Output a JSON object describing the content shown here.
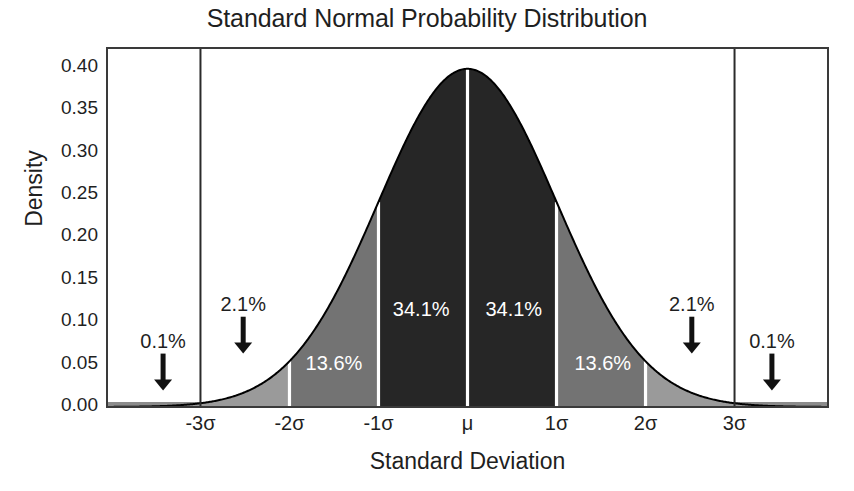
{
  "chart_data": {
    "type": "area",
    "title": "Standard Normal Probability Distribution",
    "xlabel": "Standard Deviation",
    "ylabel": "Density",
    "xtick_labels": [
      "-3σ",
      "-2σ",
      "-1σ",
      "μ",
      "1σ",
      "2σ",
      "3σ"
    ],
    "xtick_values": [
      -3,
      -2,
      -1,
      0,
      1,
      2,
      3
    ],
    "ytick_labels": [
      "0.40",
      "0.35",
      "0.30",
      "0.25",
      "0.20",
      "0.15",
      "0.10",
      "0.05",
      "0.00"
    ],
    "ytick_values": [
      0.4,
      0.35,
      0.3,
      0.25,
      0.2,
      0.15,
      0.1,
      0.05,
      0.0
    ],
    "xlim": [
      -4.05,
      4.05
    ],
    "ylim": [
      0.0,
      0.4235
    ],
    "grid": false,
    "legend": false,
    "distribution": {
      "name": "standard normal",
      "mean": 0,
      "sd": 1,
      "peak_density": 0.3989
    },
    "bands": [
      {
        "from": -4.05,
        "to": -3,
        "label": "0.1%",
        "fill": "#9a9a9a",
        "label_placement": "outside"
      },
      {
        "from": -3,
        "to": -2,
        "label": "2.1%",
        "fill": "#9a9a9a",
        "label_placement": "outside"
      },
      {
        "from": -2,
        "to": -1,
        "label": "13.6%",
        "fill": "#737373",
        "label_placement": "inside"
      },
      {
        "from": -1,
        "to": 0,
        "label": "34.1%",
        "fill": "#262626",
        "label_placement": "inside"
      },
      {
        "from": 0,
        "to": 1,
        "label": "34.1%",
        "fill": "#262626",
        "label_placement": "inside"
      },
      {
        "from": 1,
        "to": 2,
        "label": "13.6%",
        "fill": "#737373",
        "label_placement": "inside"
      },
      {
        "from": 2,
        "to": 3,
        "label": "2.1%",
        "fill": "#9a9a9a",
        "label_placement": "outside"
      },
      {
        "from": 3,
        "to": 4.05,
        "label": "0.1%",
        "fill": "#9a9a9a",
        "label_placement": "outside"
      }
    ],
    "inside_labels": [
      {
        "text": "13.6%",
        "x": -1.5,
        "y": 0.052
      },
      {
        "text": "34.1%",
        "x": -0.52,
        "y": 0.116
      },
      {
        "text": "34.1%",
        "x": 0.52,
        "y": 0.116
      },
      {
        "text": "13.6%",
        "x": 1.52,
        "y": 0.052
      }
    ],
    "outside_annotations": [
      {
        "text": "0.1%",
        "x": -3.42,
        "text_y": 0.0745,
        "arrow_from_y": 0.063,
        "arrow_to_y": 0.0195
      },
      {
        "text": "2.1%",
        "x": -2.52,
        "text_y": 0.118,
        "arrow_from_y": 0.1065,
        "arrow_to_y": 0.063
      },
      {
        "text": "2.1%",
        "x": 2.52,
        "text_y": 0.118,
        "arrow_from_y": 0.1065,
        "arrow_to_y": 0.063
      },
      {
        "text": "0.1%",
        "x": 3.42,
        "text_y": 0.0745,
        "arrow_from_y": 0.063,
        "arrow_to_y": 0.0195
      }
    ],
    "vertical_rules": [
      {
        "x": -3,
        "full_height": true
      },
      {
        "x": 3,
        "full_height": true
      }
    ],
    "divider_color": "#ffffff",
    "curve_color": "#000000",
    "frame_color": "#3a3a3a",
    "background_color": "#ffffff",
    "baseline_strip_color": "#8c8c8c"
  },
  "geometry": {
    "plot_left": 107,
    "plot_right": 828,
    "plot_top": 48,
    "plot_bottom": 407
  }
}
